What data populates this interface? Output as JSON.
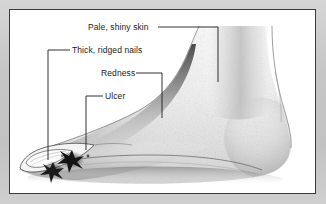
{
  "figure": {
    "kind": "medical-illustration",
    "frame_color": "#3a3a3a",
    "mat_color": "#c6c6c6",
    "plate_color": "#ffffff",
    "ink_color": "#1c1c1c"
  },
  "annotations": [
    {
      "id": "pale-shiny-skin",
      "label": "Pale, shiny skin",
      "points_to": "instep / dorsum of foot"
    },
    {
      "id": "thick-ridged-nails",
      "label": "Thick, ridged nails",
      "points_to": "toenail"
    },
    {
      "id": "redness",
      "label": "Redness",
      "points_to": "arch of foot"
    },
    {
      "id": "ulcer",
      "label": "Ulcer",
      "points_to": "ulcerated lesion on forefoot"
    }
  ],
  "artwork": {
    "toe_nail_label": "toenail outline",
    "ulcer_lesion_label": "ulcer lesion",
    "arch_shadow_label": "arch shading",
    "heel_label": "heel",
    "ankle_label": "ankle and lower leg",
    "sole_label": "sole line",
    "ground_shadow_label": "ground shadow"
  }
}
